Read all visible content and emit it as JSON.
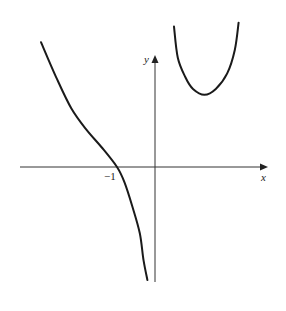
{
  "chart_data": {
    "type": "line",
    "title": "",
    "xlabel": "x",
    "ylabel": "y",
    "tick_labels": {
      "x": [
        "-1"
      ]
    },
    "tick_values": {
      "x": [
        -1
      ]
    },
    "xlim": [
      -3.5,
      3.1
    ],
    "ylim": [
      -3.0,
      3.5
    ],
    "grid": false,
    "legend": "none",
    "series": [
      {
        "name": "left-branch",
        "points": [
          [
            -3.0,
            3.2
          ],
          [
            -2.6,
            2.3
          ],
          [
            -2.2,
            1.5
          ],
          [
            -1.8,
            0.95
          ],
          [
            -1.4,
            0.5
          ],
          [
            -1.0,
            0.0
          ],
          [
            -0.8,
            -0.4
          ],
          [
            -0.6,
            -1.0
          ],
          [
            -0.4,
            -1.7
          ],
          [
            -0.3,
            -2.4
          ],
          [
            -0.2,
            -2.9
          ]
        ]
      },
      {
        "name": "right-branch",
        "points": [
          [
            0.5,
            3.6
          ],
          [
            0.6,
            2.8
          ],
          [
            0.8,
            2.3
          ],
          [
            1.0,
            2.0
          ],
          [
            1.3,
            1.85
          ],
          [
            1.6,
            2.0
          ],
          [
            1.9,
            2.4
          ],
          [
            2.1,
            3.0
          ],
          [
            2.2,
            3.7
          ]
        ]
      }
    ],
    "annotations": []
  }
}
